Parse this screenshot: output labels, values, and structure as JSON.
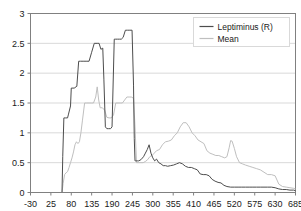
{
  "chart_data": {
    "type": "line",
    "title": "",
    "xlabel": "",
    "ylabel": "",
    "xlim": [
      -30,
      685
    ],
    "ylim": [
      0,
      3
    ],
    "grid": "horizontal",
    "legend_position": "top-right",
    "x_ticks": [
      "-30",
      "25",
      "80",
      "135",
      "190",
      "245",
      "300",
      "355",
      "410",
      "465",
      "520",
      "575",
      "630",
      "685"
    ],
    "y_ticks": [
      "0",
      "0.5",
      "1",
      "1.5",
      "2",
      "2.5",
      "3"
    ],
    "colors": {
      "leptiminus": "#4d4d4d",
      "mean": "#bfbfbf",
      "axis": "#808080",
      "grid": "#d9d9d9",
      "text": "#1a1a1a"
    },
    "series": [
      {
        "name": "Leptiminus (R)",
        "color": "#4d4d4d",
        "x": [
          55,
          57,
          60,
          65,
          70,
          72,
          78,
          80,
          88,
          95,
          100,
          105,
          112,
          120,
          128,
          135,
          142,
          150,
          155,
          160,
          165,
          168,
          172,
          176,
          180,
          186,
          190,
          196,
          200,
          205,
          210,
          215,
          220,
          226,
          232,
          238,
          244,
          248,
          250,
          252,
          254,
          258,
          262,
          268,
          275,
          280,
          285,
          290,
          295,
          300,
          305,
          310,
          316,
          322,
          328,
          334,
          340,
          348,
          356,
          364,
          372,
          380,
          388,
          396,
          404,
          412,
          420,
          428,
          436,
          444,
          452,
          460,
          468,
          476,
          484,
          492,
          500,
          510,
          520,
          530,
          540,
          550,
          560,
          570,
          580,
          590,
          600,
          610,
          620,
          630,
          640,
          650,
          660,
          670,
          680,
          685
        ],
        "y": [
          0.0,
          0.6,
          1.25,
          1.25,
          1.25,
          1.3,
          1.45,
          1.75,
          1.75,
          1.78,
          2.2,
          2.2,
          2.2,
          2.2,
          2.2,
          2.35,
          2.5,
          2.5,
          2.5,
          2.4,
          2.42,
          1.9,
          1.1,
          1.07,
          1.07,
          1.07,
          1.1,
          2.57,
          2.57,
          2.57,
          2.57,
          2.57,
          2.6,
          2.72,
          2.72,
          2.72,
          2.72,
          1.8,
          0.9,
          0.53,
          0.53,
          0.53,
          0.53,
          0.55,
          0.6,
          0.66,
          0.72,
          0.8,
          0.66,
          0.58,
          0.53,
          0.56,
          0.5,
          0.48,
          0.45,
          0.45,
          0.44,
          0.45,
          0.46,
          0.48,
          0.5,
          0.48,
          0.44,
          0.42,
          0.42,
          0.4,
          0.38,
          0.31,
          0.3,
          0.3,
          0.28,
          0.22,
          0.19,
          0.17,
          0.16,
          0.12,
          0.1,
          0.09,
          0.09,
          0.09,
          0.09,
          0.09,
          0.09,
          0.09,
          0.09,
          0.09,
          0.09,
          0.09,
          0.09,
          0.08,
          0.06,
          0.05,
          0.05,
          0.04,
          0.04,
          0.03
        ]
      },
      {
        "name": "Mean",
        "color": "#bfbfbf",
        "x": [
          55,
          58,
          62,
          66,
          70,
          74,
          78,
          82,
          86,
          90,
          94,
          98,
          102,
          106,
          110,
          116,
          122,
          128,
          134,
          140,
          146,
          150,
          154,
          158,
          164,
          170,
          176,
          182,
          188,
          194,
          200,
          206,
          212,
          218,
          224,
          230,
          236,
          242,
          248,
          252,
          256,
          262,
          268,
          274,
          280,
          286,
          292,
          298,
          304,
          310,
          318,
          326,
          334,
          342,
          350,
          358,
          366,
          374,
          382,
          390,
          398,
          406,
          414,
          422,
          430,
          438,
          446,
          454,
          462,
          470,
          478,
          486,
          494,
          500,
          506,
          510,
          514,
          520,
          526,
          534,
          542,
          550,
          560,
          570,
          580,
          590,
          600,
          610,
          620,
          630,
          640,
          650,
          660,
          670,
          680,
          685
        ],
        "y": [
          0.0,
          0.15,
          0.3,
          0.33,
          0.35,
          0.42,
          0.5,
          0.58,
          0.68,
          0.8,
          0.85,
          0.82,
          0.85,
          1.0,
          1.2,
          1.5,
          1.5,
          1.5,
          1.5,
          1.5,
          1.6,
          1.77,
          1.55,
          1.42,
          1.42,
          1.38,
          1.26,
          1.25,
          1.25,
          1.3,
          1.5,
          1.5,
          1.5,
          1.5,
          1.55,
          1.6,
          1.6,
          1.6,
          1.58,
          1.1,
          0.5,
          0.5,
          0.5,
          0.5,
          0.52,
          0.55,
          0.6,
          0.62,
          0.66,
          0.7,
          0.72,
          0.8,
          0.85,
          0.86,
          0.88,
          0.95,
          1.0,
          1.1,
          1.17,
          1.17,
          1.1,
          1.0,
          0.95,
          0.88,
          0.85,
          0.82,
          0.7,
          0.66,
          0.64,
          0.62,
          0.62,
          0.6,
          0.58,
          0.6,
          0.75,
          0.87,
          0.86,
          0.74,
          0.6,
          0.5,
          0.48,
          0.46,
          0.44,
          0.42,
          0.4,
          0.38,
          0.34,
          0.3,
          0.3,
          0.28,
          0.14,
          0.1,
          0.09,
          0.08,
          0.07,
          0.06
        ]
      }
    ]
  },
  "legend": {
    "items": [
      {
        "label": "Leptiminus (R)"
      },
      {
        "label": "Mean"
      }
    ]
  }
}
